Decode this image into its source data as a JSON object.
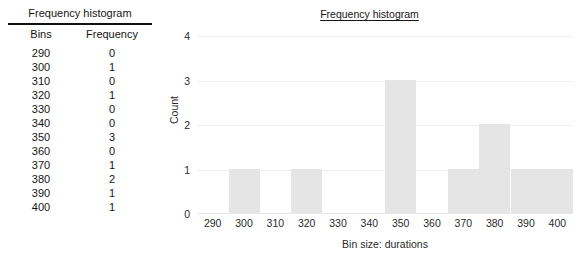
{
  "table": {
    "title": "Frequency histogram",
    "columns": [
      "Bins",
      "Frequency"
    ],
    "rows": [
      {
        "bin": "290",
        "frequency": "0"
      },
      {
        "bin": "300",
        "frequency": "1"
      },
      {
        "bin": "310",
        "frequency": "0"
      },
      {
        "bin": "320",
        "frequency": "1"
      },
      {
        "bin": "330",
        "frequency": "0"
      },
      {
        "bin": "340",
        "frequency": "0"
      },
      {
        "bin": "350",
        "frequency": "3"
      },
      {
        "bin": "360",
        "frequency": "0"
      },
      {
        "bin": "370",
        "frequency": "1"
      },
      {
        "bin": "380",
        "frequency": "2"
      },
      {
        "bin": "390",
        "frequency": "1"
      },
      {
        "bin": "400",
        "frequency": "1"
      }
    ]
  },
  "chart_data": {
    "type": "bar",
    "title": "Frequency histogram",
    "xlabel": "Bin size: durations",
    "ylabel": "Count",
    "categories": [
      "290",
      "300",
      "310",
      "320",
      "330",
      "340",
      "350",
      "360",
      "370",
      "380",
      "390",
      "400"
    ],
    "values": [
      0,
      1,
      0,
      1,
      0,
      0,
      3,
      0,
      1,
      2,
      1,
      1
    ],
    "ylim": [
      0,
      4
    ],
    "yticks": [
      "0",
      "1",
      "2",
      "3",
      "4"
    ],
    "grid": true,
    "legend": false,
    "bar_color": "#e5e5e5",
    "grid_color": "#efefef"
  }
}
